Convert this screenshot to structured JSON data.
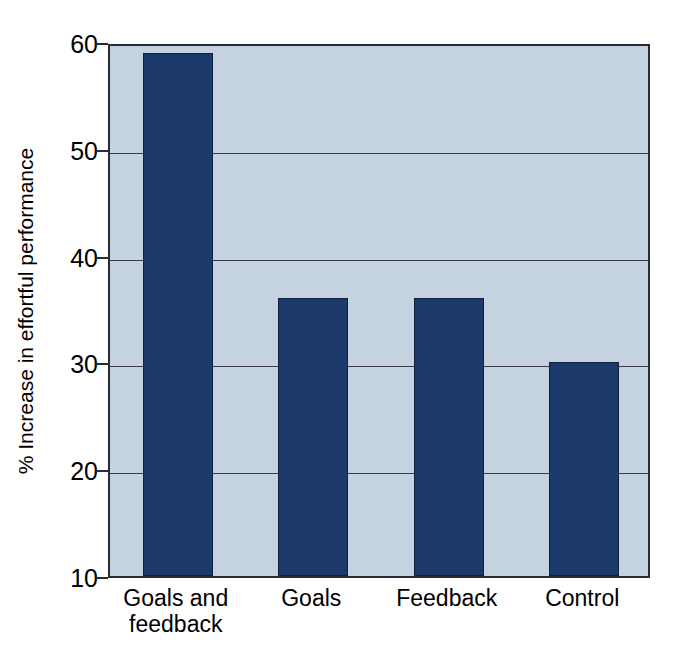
{
  "chart_data": {
    "type": "bar",
    "title": "",
    "subtitle": "",
    "xlabel": "",
    "ylabel": "% Increase in effortful performance",
    "categories": [
      "Goals and\nfeedback",
      "Goals",
      "Feedback",
      "Control"
    ],
    "category_labels_flat": [
      "Goals and feedback",
      "Goals",
      "Feedback",
      "Control"
    ],
    "values": [
      59,
      36,
      36,
      30
    ],
    "ylim": [
      10,
      60
    ],
    "yticks": [
      10,
      20,
      30,
      40,
      50,
      60
    ],
    "ytick_labels": [
      "10",
      "20",
      "30",
      "40",
      "50",
      "60"
    ],
    "xticks_shown": false,
    "grid": "horizontal",
    "legend": "none",
    "annotations": [],
    "series": [
      {
        "name": "% Increase in effortful performance",
        "values": [
          59,
          36,
          36,
          30
        ]
      }
    ]
  },
  "style": {
    "bar_color": "#1b3a6b",
    "bar_edge_color": "#101f3d",
    "plot_background": "#c5d2e0",
    "figure_background": "#ffffff",
    "axis_color": "#2b2b33",
    "gridline_color": "#3a3a44",
    "text_color": "#000000"
  }
}
